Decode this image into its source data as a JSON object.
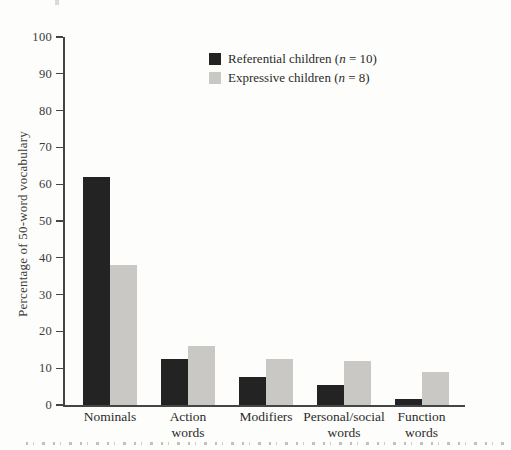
{
  "figure": {
    "background_color": "#fdfdfb",
    "axis_color": "#454545",
    "text_color": "#2f2f2f",
    "ylabel": "Percentage of 50-word vocabulary",
    "legend_items": [
      {
        "pre": "Referential children (",
        "var": "n",
        "post": " = 10)",
        "color": "#232323"
      },
      {
        "pre": "Expressive children (",
        "var": "n",
        "post": " = 8)",
        "color": "#c9c8c5"
      }
    ],
    "clipped_caption_visible": true
  },
  "chart_data": {
    "type": "bar",
    "title": "",
    "xlabel": "",
    "ylabel": "Percentage of 50-word vocabulary",
    "categories": [
      "Nominals",
      "Action words",
      "Modifiers",
      "Personal/social words",
      "Function words"
    ],
    "category_label_lines": [
      [
        "Nominals"
      ],
      [
        "Action",
        "words"
      ],
      [
        "Modifiers"
      ],
      [
        "Personal/social",
        "words"
      ],
      [
        "Function",
        "words"
      ]
    ],
    "series": [
      {
        "name": "Referential children (n = 10)",
        "color": "#232323",
        "values": [
          62,
          12.5,
          7.5,
          5.5,
          1.5
        ]
      },
      {
        "name": "Expressive children (n = 8)",
        "color": "#c9c8c5",
        "values": [
          38,
          16,
          12.5,
          12,
          9
        ]
      }
    ],
    "ylim": [
      0,
      100
    ],
    "yticks": [
      0,
      10,
      20,
      30,
      40,
      50,
      60,
      70,
      80,
      90,
      100
    ],
    "grid": false,
    "legend_position": "top-center-inside"
  }
}
